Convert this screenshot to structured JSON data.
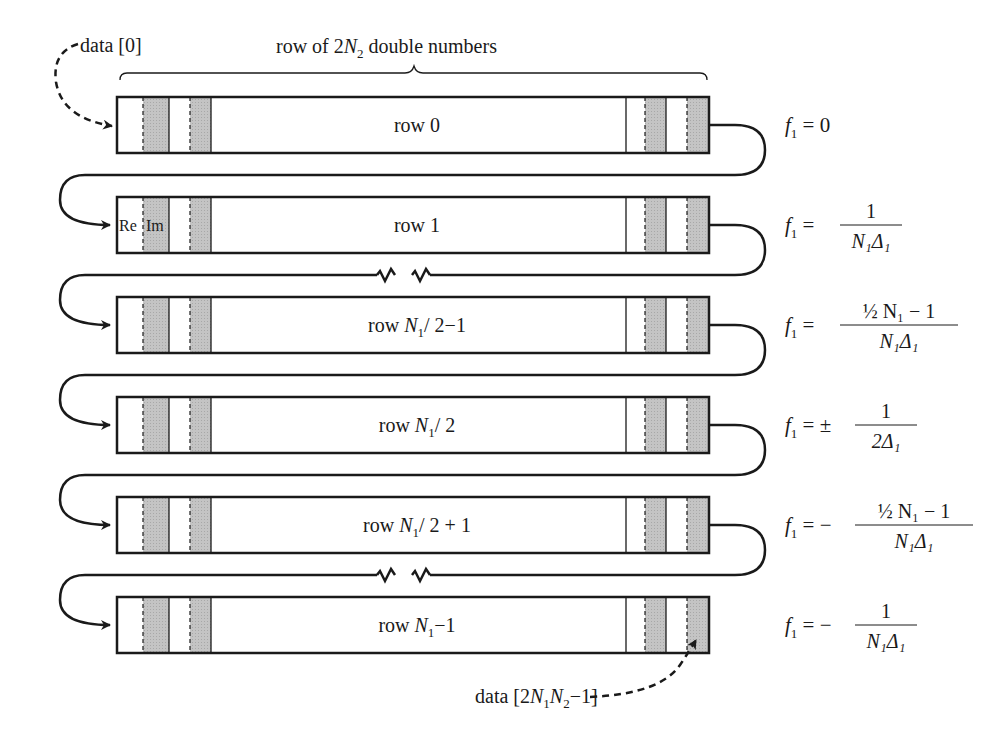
{
  "header": {
    "brace_label_prefix": "row of 2",
    "brace_label_var": "N",
    "brace_label_sub": "2",
    "brace_label_suffix": " double numbers"
  },
  "pointers": {
    "start": {
      "label": "data [0]"
    },
    "end": {
      "prefix": "data [2",
      "v1": "N",
      "s1": "1",
      "v2": "N",
      "s2": "2",
      "suffix": "−1]"
    }
  },
  "cell_labels": {
    "re": "Re",
    "im": "Im"
  },
  "rows": [
    {
      "pre": "row ",
      "text": "0",
      "var": "",
      "sub": "",
      "post": ""
    },
    {
      "pre": "row ",
      "text": "1",
      "var": "",
      "sub": "",
      "post": ""
    },
    {
      "pre": "row ",
      "text": "",
      "var": "N",
      "sub": "1",
      "post": "/ 2−1"
    },
    {
      "pre": "row ",
      "text": "",
      "var": "N",
      "sub": "1",
      "post": "/ 2"
    },
    {
      "pre": "row ",
      "text": "",
      "var": "N",
      "sub": "1",
      "post": "/ 2 + 1"
    },
    {
      "pre": "row ",
      "text": "",
      "var": "N",
      "sub": "1",
      "post": "−1"
    }
  ],
  "frequencies": [
    {
      "lhs": "f",
      "lhs_sub": "1",
      "eq": "= 0",
      "sign": "",
      "num": "",
      "den": ""
    },
    {
      "lhs": "f",
      "lhs_sub": "1",
      "eq": "=",
      "sign": "",
      "num": "1",
      "den": "N₁Δ₁"
    },
    {
      "lhs": "f",
      "lhs_sub": "1",
      "eq": "=",
      "sign": "",
      "num": "½ N₁ − 1",
      "den": "N₁Δ₁"
    },
    {
      "lhs": "f",
      "lhs_sub": "1",
      "eq": "=",
      "sign": "±",
      "num": "1",
      "den": "2Δ₁"
    },
    {
      "lhs": "f",
      "lhs_sub": "1",
      "eq": "=",
      "sign": "−",
      "num": "½ N₁ − 1",
      "den": "N₁Δ₁"
    },
    {
      "lhs": "f",
      "lhs_sub": "1",
      "eq": "=",
      "sign": "−",
      "num": "1",
      "den": "N₁Δ₁"
    }
  ],
  "colors": {
    "ink": "#1a1a1a",
    "cell_fill": "#bdbdbd",
    "background": "#ffffff"
  }
}
